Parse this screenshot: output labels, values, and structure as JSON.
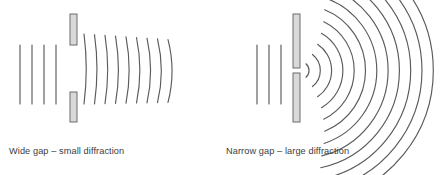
{
  "figure": {
    "background_color": "#ffffff",
    "stroke_color": "#5a5a5a",
    "barrier_fill": "#d9d9d9",
    "barrier_stroke": "#6b6b6b",
    "text_color": "#3c3c3c"
  },
  "panels": [
    {
      "id": "wide-gap",
      "caption": "Wide gap – small diffraction",
      "barrier": {
        "x": 70,
        "width": 7,
        "top": 14,
        "bottom": 122,
        "gap_top": 45,
        "gap_bottom": 92,
        "gap_size": 47,
        "gap_label": "wide"
      },
      "incoming_waves": {
        "count": 4,
        "x_positions": [
          20,
          32,
          44,
          56
        ],
        "y_top": 45,
        "y_bottom": 104,
        "shape": "straight-vertical-plane-wave"
      },
      "outgoing_waves": {
        "count": 9,
        "shape": "slightly-curved-plane-wave",
        "first_x": 84,
        "spacing": 10.5,
        "y_top": 34,
        "y_bottom": 104,
        "curvature": "low",
        "description": "nearly flat wavefronts, only slight bending at the edges"
      }
    },
    {
      "id": "narrow-gap",
      "caption": "Narrow gap – large diffraction",
      "barrier": {
        "x": 293,
        "width": 7,
        "top": 14,
        "bottom": 122,
        "gap_top": 68,
        "gap_bottom": 73,
        "gap_size": 5,
        "gap_label": "narrow"
      },
      "incoming_waves": {
        "count": 3,
        "x_positions": [
          257,
          269,
          281
        ],
        "y_top": 45,
        "y_bottom": 104,
        "shape": "straight-vertical-plane-wave"
      },
      "outgoing_waves": {
        "count": 12,
        "shape": "circular-arc",
        "center_x": 300,
        "center_y": 70.5,
        "first_radius": 9,
        "spacing": 11.3,
        "angle_start_deg": -78,
        "angle_end_deg": 78,
        "curvature": "high",
        "description": "concentric semicircular wavefronts spreading widely from the slit"
      }
    }
  ]
}
